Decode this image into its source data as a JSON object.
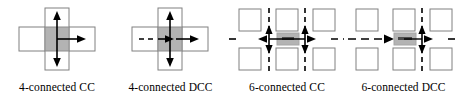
{
  "figure": {
    "panel_count": 4,
    "colors": {
      "cell_fill": "#ffffff",
      "cell_stroke": "#808080",
      "center_fill": "#b3b3b3",
      "center_stroke": "#8c8c8c",
      "arrow": "#000000",
      "dash": "#000000",
      "text": "#000000",
      "background": "#ffffff"
    },
    "panels": [
      {
        "id": "4-connected-cc",
        "caption": "4-connected CC",
        "layout": "plus-cross",
        "cells": 5,
        "center_cell": "shaded",
        "arrows": [
          {
            "name": "arrow-up",
            "direction": "up",
            "style": "solid",
            "heads": 1
          },
          {
            "name": "arrow-down",
            "direction": "down",
            "style": "solid",
            "heads": 1
          },
          {
            "name": "arrow-right",
            "direction": "right",
            "style": "solid",
            "heads": 1
          }
        ],
        "dashed_entries": []
      },
      {
        "id": "4-connected-dcc",
        "caption": "4-connected DCC",
        "layout": "plus-cross",
        "cells": 5,
        "center_cell": "shaded",
        "arrows": [
          {
            "name": "arrow-up",
            "direction": "up",
            "style": "solid",
            "heads": 1
          },
          {
            "name": "arrow-down",
            "direction": "down",
            "style": "solid",
            "heads": 1
          },
          {
            "name": "arrow-right",
            "direction": "right",
            "style": "solid",
            "heads": 1
          },
          {
            "name": "arrow-right-inner",
            "direction": "right",
            "style": "solid",
            "heads": 1
          }
        ],
        "dashed_entries": [
          {
            "name": "dashed-entry-left",
            "direction": "right",
            "style": "dashed"
          }
        ]
      },
      {
        "id": "6-connected-cc",
        "caption": "6-connected CC",
        "layout": "grid-3x3",
        "cells": 6,
        "center_cell": "shaded-bar",
        "arrows": [
          {
            "name": "arrow-vertical-left",
            "direction": "vertical",
            "style": "solid",
            "heads": 2
          },
          {
            "name": "arrow-vertical-right",
            "direction": "vertical",
            "style": "solid",
            "heads": 2
          },
          {
            "name": "arrow-horizontal",
            "direction": "right",
            "style": "solid",
            "heads": 1
          }
        ],
        "dashed_entries": [
          {
            "name": "dashed-segment-far-left",
            "direction": "left",
            "style": "dashed"
          },
          {
            "name": "dashed-segment-far-right",
            "direction": "right",
            "style": "dashed"
          }
        ]
      },
      {
        "id": "6-connected-dcc",
        "caption": "6-connected DCC",
        "layout": "grid-3x3",
        "cells": 6,
        "center_cell": "shaded-bar",
        "arrows": [
          {
            "name": "arrow-vertical-right",
            "direction": "vertical",
            "style": "solid",
            "heads": 2
          },
          {
            "name": "arrow-dashed-left",
            "direction": "right",
            "style": "dashed",
            "heads": 1
          }
        ],
        "dashed_entries": [
          {
            "name": "dashed-segment-far-right",
            "direction": "right",
            "style": "dashed"
          }
        ]
      }
    ]
  }
}
